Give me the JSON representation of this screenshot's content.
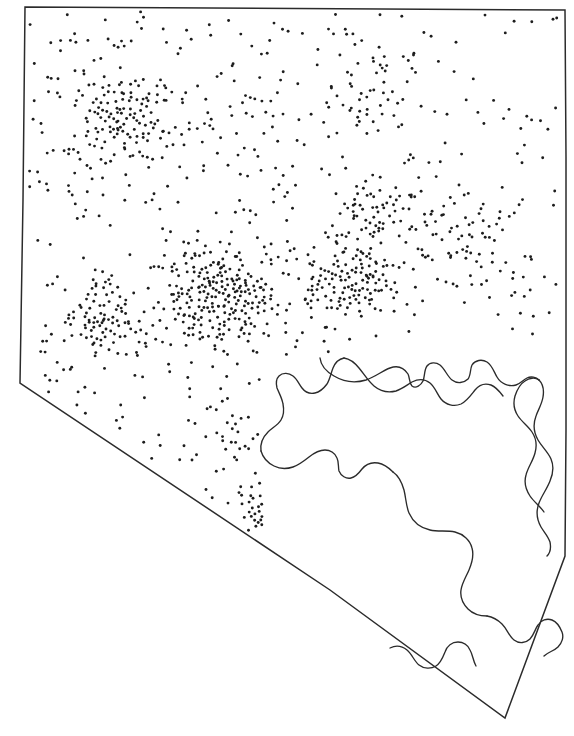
{
  "figure": {
    "type": "dot-density-map",
    "region_name": "Nevada",
    "background_color": "#ffffff",
    "outline_color": "#2b2b2b",
    "dot_color": "#1d1d1d",
    "dot_radius_px": 1.45,
    "canvas": {
      "width": 574,
      "height": 736
    }
  },
  "chart_data": {
    "type": "scatter",
    "title": "",
    "subtitle": "",
    "xlabel": "",
    "ylabel": "",
    "grid": false,
    "legend": null,
    "annotations": [],
    "xlim": [
      0,
      574
    ],
    "ylim": [
      736,
      0
    ],
    "state_outline_path": "M 25 7 L 565 10 L 566 157 L 566 330 L 566 430 L 565 556 L 505 718 L 330 590 L 20 383 L 23 200 Z",
    "state_outline_vertices": [
      [
        25,
        7
      ],
      [
        565,
        10
      ],
      [
        565,
        556
      ],
      [
        505,
        718
      ],
      [
        330,
        590
      ],
      [
        20,
        383
      ]
    ],
    "internal_boundaries": [
      {
        "name": "lake-mead-boundary-north",
        "path": "M 320 358 C 321 367 327 372 334 376 C 344 382 356 383 366 380 C 375 377 382 371 390 368 C 398 365 404 368 408 374 C 410 378 409 383 412 386 C 416 389 421 385 423 381 C 425 376 424 370 427 366 C 430 362 436 362 440 365 C 445 369 447 376 452 380 C 457 384 464 383 468 379 C 471 375 470 369 472 365 C 475 360 482 359 487 362 C 492 365 494 372 497 377 C 501 384 509 387 516 385 C 520 384 523 380 527 378 C 531 376 536 377 539 380"
      },
      {
        "name": "lake-mead-boundary-south-arm",
        "path": "M 539 380 C 543 384 544 391 543 397 C 542 404 538 410 536 416 C 533 424 534 433 538 440 C 542 447 548 452 551 459 C 554 466 553 474 550 481 C 547 489 542 495 539 503 C 536 511 537 520 541 527 C 544 532 548 536 550 542 C 551 547 550 553 547 556"
      },
      {
        "name": "colorado-river-inner-loop",
        "path": "M 539 380 C 535 377 529 378 525 381 C 520 384 517 390 515 396 C 513 403 514 410 518 416 C 522 422 528 426 532 432 C 536 438 537 446 535 453 C 533 461 528 467 526 475 C 524 482 526 490 530 496 C 534 502 540 506 544 512"
      },
      {
        "name": "boundary-west-arc",
        "path": "M 261 451 C 260 444 263 437 268 432 C 272 428 278 425 281 420 C 284 415 284 409 283 404 C 282 398 279 393 277 388 C 276 384 276 379 279 376 C 283 372 289 373 293 376 C 297 379 299 384 302 388 C 305 392 310 394 315 393 C 320 392 324 388 327 384 C 330 379 331 373 333 368 C 335 363 339 359 344 358"
      },
      {
        "name": "boundary-central-arc",
        "path": "M 261 451 C 263 458 268 463 274 466 C 280 469 287 469 293 467 C 299 465 304 461 309 457 C 314 453 319 450 325 450 C 330 450 335 453 337 458 C 339 462 338 467 339 471 C 341 476 346 479 351 478 C 356 477 359 473 362 469 C 366 464 372 462 378 463 C 384 464 389 468 393 472"
      },
      {
        "name": "boundary-mid-peninsula",
        "path": "M 344 358 C 350 359 355 363 359 368 C 364 374 368 381 374 386 C 380 391 388 393 396 391 C 402 389 407 385 412 382 C 418 379 425 379 430 383 C 435 387 437 394 441 399 C 446 405 454 407 461 404 C 467 401 471 395 475 390 C 479 385 485 383 491 385 C 496 387 500 392 503 396"
      },
      {
        "name": "boundary-south-lobe",
        "path": "M 393 472 C 399 476 402 483 404 490 C 406 498 406 506 409 513 C 413 522 421 528 430 530 C 438 532 447 530 455 532 C 463 534 470 540 472 548 C 474 555 472 563 469 570 C 466 577 462 583 461 590 C 460 597 463 604 468 609 C 473 614 480 616 487 616"
      },
      {
        "name": "boundary-south-detail",
        "path": "M 487 616 C 493 617 498 620 502 624 C 507 629 509 636 514 640 C 519 644 526 643 530 639 C 534 635 535 629 538 625 C 541 620 547 618 552 620 C 557 622 560 627 562 632 C 564 637 562 643 558 647 C 554 651 548 652 544 656"
      },
      {
        "name": "boundary-laughlin-tip",
        "path": "M 390 648 C 396 645 402 646 407 650 C 412 654 414 661 419 665 C 424 669 431 669 436 666 C 441 663 443 657 445 652 C 447 646 452 642 458 642 C 463 642 468 645 470 650 C 473 655 473 661 476 666"
      }
    ],
    "dot_clusters": [
      {
        "name": "reno-carson-cluster",
        "center": [
          130,
          120
        ],
        "approx_dots": 95,
        "density": "high"
      },
      {
        "name": "north-central-cluster",
        "center": [
          375,
          95
        ],
        "approx_dots": 30,
        "density": "medium"
      },
      {
        "name": "central-east-cluster",
        "center": [
          370,
          215
        ],
        "approx_dots": 55,
        "density": "medium"
      },
      {
        "name": "central-main-cluster",
        "center": [
          225,
          295
        ],
        "approx_dots": 210,
        "density": "very-high"
      },
      {
        "name": "central-right-cluster",
        "center": [
          350,
          280
        ],
        "approx_dots": 120,
        "density": "high"
      },
      {
        "name": "west-slope-cluster",
        "center": [
          105,
          320
        ],
        "approx_dots": 80,
        "density": "high"
      },
      {
        "name": "southwest-small-cluster",
        "center": [
          228,
          435
        ],
        "approx_dots": 18,
        "density": "low"
      },
      {
        "name": "las-vegas-small-cluster",
        "center": [
          268,
          510
        ],
        "approx_dots": 22,
        "density": "low"
      },
      {
        "name": "east-sparse-scatter",
        "center": [
          470,
          240
        ],
        "approx_dots": 70,
        "density": "sparse"
      }
    ],
    "dot_count_total": 1180
  }
}
